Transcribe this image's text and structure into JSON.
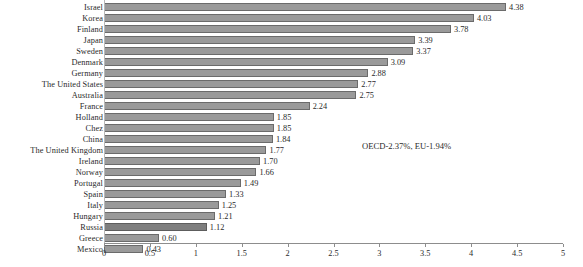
{
  "chart_data": {
    "type": "bar",
    "orientation": "horizontal",
    "title": "",
    "xlabel": "",
    "ylabel": "",
    "xlim": [
      0,
      5
    ],
    "grid": false,
    "legend": null,
    "categories": [
      "Israel",
      "Korea",
      "Finland",
      "Japan",
      "Sweden",
      "Denmark",
      "Germany",
      "The United States",
      "Australia",
      "France",
      "Holland",
      "Chez",
      "China",
      "The United Kingdom",
      "Ireland",
      "Norway",
      "Portugal",
      "Spain",
      "Italy",
      "Hungary",
      "Russia",
      "Greece",
      "Mexico"
    ],
    "values": [
      4.38,
      4.03,
      3.78,
      3.39,
      3.37,
      3.09,
      2.88,
      2.77,
      2.75,
      2.24,
      1.85,
      1.85,
      1.84,
      1.77,
      1.7,
      1.66,
      1.49,
      1.33,
      1.25,
      1.21,
      1.12,
      0.6,
      0.43
    ],
    "value_labels": [
      "4.38",
      "4.03",
      "3.78",
      "3.39",
      "3.37",
      "3.09",
      "2.88",
      "2.77",
      "2.75",
      "2.24",
      "1.85",
      "1.85",
      "1.84",
      "1.77",
      "1.70",
      "1.66",
      "1.49",
      "1.33",
      "1.25",
      "1.21",
      "1.12",
      "0.60",
      "0.43"
    ],
    "highlight_index": 20,
    "xticks": [
      0,
      0.5,
      1,
      1.5,
      2,
      2.5,
      3,
      3.5,
      4,
      4.5,
      5
    ],
    "xtick_labels": [
      "0",
      "0.5",
      "1",
      "1.5",
      "2",
      "2.5",
      "3",
      "3.5",
      "4",
      "4.5",
      "5"
    ],
    "annotations": [
      {
        "text": "OECD-2.37%, EU-1.94%"
      }
    ],
    "colors": {
      "bar_fill": "#9a9a9a",
      "bar_border": "#6b6b6b",
      "bar_fill_highlight": "#7e7e7e",
      "axis": "#8d8d8d",
      "text": "#2a2a2a",
      "background": "#ffffff"
    }
  }
}
